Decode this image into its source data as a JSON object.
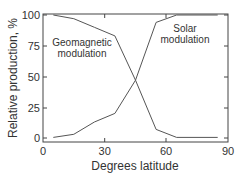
{
  "chart_data": {
    "type": "line",
    "title": "",
    "xlabel": "Degrees latitude",
    "ylabel": "Relative production, %",
    "xlim": [
      0,
      90
    ],
    "ylim": [
      0,
      100
    ],
    "xticks": [
      "0",
      "30",
      "60",
      "90"
    ],
    "yticks": [
      "0",
      "25",
      "50",
      "75",
      "100"
    ],
    "grid": false,
    "legend": "none (inline annotations)",
    "x": [
      5,
      15,
      25,
      35,
      45,
      55,
      65,
      85
    ],
    "series": [
      {
        "name": "Geomagnetic modulation",
        "values": [
          100,
          97,
          90,
          83,
          47,
          7,
          0.5,
          0.5
        ]
      },
      {
        "name": "Solar modulation",
        "values": [
          0.5,
          3,
          13,
          20,
          47,
          94,
          100,
          100
        ]
      }
    ],
    "annotations": [
      {
        "text": "Geomagnetic\nmodulation",
        "series": "Geomagnetic modulation"
      },
      {
        "text": "Solar\nmodulation",
        "series": "Solar modulation"
      }
    ]
  },
  "labels": {
    "xlabel": "Degrees latitude",
    "ylabel": "Relative production, %",
    "geo_line1": "Geomagnetic",
    "geo_line2": "modulation",
    "solar_line1": "Solar",
    "solar_line2": "modulation",
    "xt0": "0",
    "xt30": "30",
    "xt60": "60",
    "xt90": "90",
    "yt0": "0",
    "yt25": "25",
    "yt50": "50",
    "yt75": "75",
    "yt100": "100"
  },
  "colors": {
    "line": "#555555",
    "frame": "#444444",
    "text": "#333333"
  }
}
